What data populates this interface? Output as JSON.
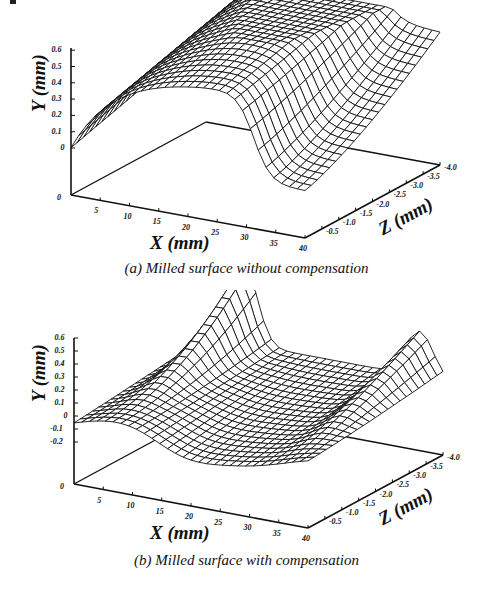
{
  "figures": [
    {
      "id": "a",
      "caption": "(a) Milled surface without compensation",
      "x_title": "X (mm)",
      "y_title": "Y (mm)",
      "z_title": "Z (mm)",
      "y_ticks": [
        "0.6",
        "0.5",
        "0.4",
        "0.3",
        "0.2",
        "0.1",
        "0"
      ],
      "x_ticks": [
        "0",
        "5",
        "10",
        "15",
        "20",
        "25",
        "30",
        "35",
        "40"
      ],
      "z_ticks": [
        "-0.5",
        "-1.0",
        "-1.5",
        "-2.0",
        "-2.5",
        "-3.0",
        "-3.5",
        "-4.0"
      ]
    },
    {
      "id": "b",
      "caption": "(b) Milled surface with compensation",
      "x_title": "X (mm)",
      "y_title": "Y (mm)",
      "z_title": "Z (mm)",
      "y_ticks": [
        "0.6",
        "0.5",
        "0.4",
        "0.3",
        "0.2",
        "0.1",
        "0",
        "-0.1",
        "-0.2"
      ],
      "x_ticks": [
        "0",
        "5",
        "10",
        "15",
        "20",
        "25",
        "30",
        "35",
        "40"
      ],
      "z_ticks": [
        "-0.5",
        "-1.0",
        "-1.5",
        "-2.0",
        "-2.5",
        "-3.0",
        "-3.5",
        "-4.0"
      ]
    }
  ],
  "chart_data": [
    {
      "type": "surface",
      "title": "(a) Milled surface without compensation",
      "xlabel": "X (mm)",
      "ylabel": "Y (mm)",
      "zlabel": "Z (mm)",
      "xlim": [
        0,
        40
      ],
      "ylim": [
        0,
        0.6
      ],
      "zlim": [
        -4.0,
        0
      ],
      "x_ticks": [
        0,
        5,
        10,
        15,
        20,
        25,
        30,
        35,
        40
      ],
      "y_ticks": [
        0,
        0.1,
        0.2,
        0.3,
        0.4,
        0.5,
        0.6
      ],
      "z_ticks": [
        -0.5,
        -1.0,
        -1.5,
        -2.0,
        -2.5,
        -3.0,
        -3.5,
        -4.0
      ],
      "description": "Wireframe surface rising from ~0 mm at X=0 to a broad ridge of ~0.5-0.6 mm, dropping sharply near X≈30-35 mm to ~0 then a raised shelf near Z=-4",
      "profile_x": [
        0,
        5,
        10,
        15,
        20,
        25,
        30,
        35,
        40
      ],
      "profile_y_front": [
        0.0,
        0.3,
        0.42,
        0.48,
        0.52,
        0.5,
        0.35,
        0.05,
        0.0
      ],
      "profile_y_back": [
        0.35,
        0.45,
        0.5,
        0.55,
        0.58,
        0.56,
        0.5,
        0.35,
        0.32
      ]
    },
    {
      "type": "surface",
      "title": "(b) Milled surface with compensation",
      "xlabel": "X (mm)",
      "ylabel": "Y (mm)",
      "zlabel": "Z (mm)",
      "xlim": [
        0,
        40
      ],
      "ylim": [
        -0.2,
        0.6
      ],
      "zlim": [
        -4.0,
        0
      ],
      "x_ticks": [
        0,
        5,
        10,
        15,
        20,
        25,
        30,
        35,
        40
      ],
      "y_ticks": [
        -0.2,
        -0.1,
        0,
        0.1,
        0.2,
        0.3,
        0.4,
        0.5,
        0.6
      ],
      "z_ticks": [
        -0.5,
        -1.0,
        -1.5,
        -2.0,
        -2.5,
        -3.0,
        -3.5,
        -4.0
      ],
      "description": "Wireframe surface fluctuating around 0 mm (roughly -0.1 to 0.1) with edge peaks near 0.5-0.6 mm at the back-left and a raised ridge at the right rear edge",
      "profile_x": [
        0,
        5,
        10,
        15,
        20,
        25,
        30,
        35,
        40
      ],
      "profile_y_front": [
        -0.1,
        0.05,
        0.0,
        -0.1,
        -0.15,
        -0.1,
        0.0,
        -0.05,
        -0.1
      ],
      "profile_y_back": [
        0.1,
        0.3,
        0.6,
        0.1,
        0.15,
        0.1,
        0.05,
        0.25,
        0.3
      ]
    }
  ]
}
